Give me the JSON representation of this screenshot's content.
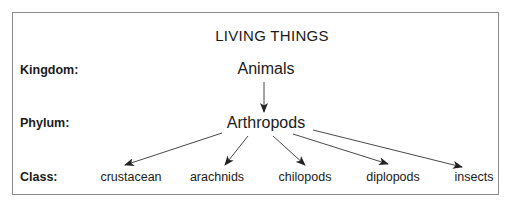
{
  "diagram": {
    "title": "LIVING THINGS",
    "rows": {
      "kingdom": {
        "label": "Kingdom:",
        "nodes": [
          "Animals"
        ]
      },
      "phylum": {
        "label": "Phylum:",
        "nodes": [
          "Arthropods"
        ]
      },
      "class": {
        "label": "Class:",
        "nodes": [
          "crustacean",
          "arachnids",
          "chilopods",
          "diplopods",
          "insects"
        ]
      }
    },
    "edges": [
      {
        "from": "Animals",
        "to": "Arthropods"
      },
      {
        "from": "Arthropods",
        "to": "crustacean"
      },
      {
        "from": "Arthropods",
        "to": "arachnids"
      },
      {
        "from": "Arthropods",
        "to": "chilopods"
      },
      {
        "from": "Arthropods",
        "to": "diplopods"
      },
      {
        "from": "Arthropods",
        "to": "insects"
      }
    ],
    "colors": {
      "border": "#8a8a8a",
      "text": "#1a1a1a",
      "arrow": "#222222"
    }
  }
}
